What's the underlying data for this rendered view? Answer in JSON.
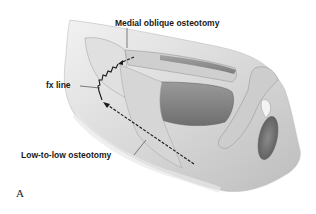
{
  "figure": {
    "panel_letter": "A",
    "labels": {
      "medial_oblique": "Medial oblique osteotomy",
      "fx_line": "fx line",
      "low_to_low": "Low-to-low osteotomy"
    },
    "colors": {
      "background": "#ffffff",
      "skin_light": "#e6e6e6",
      "skin_mid": "#c8c8c8",
      "shadow_dark": "#7a7a7a",
      "line": "#1a1a1a"
    }
  }
}
